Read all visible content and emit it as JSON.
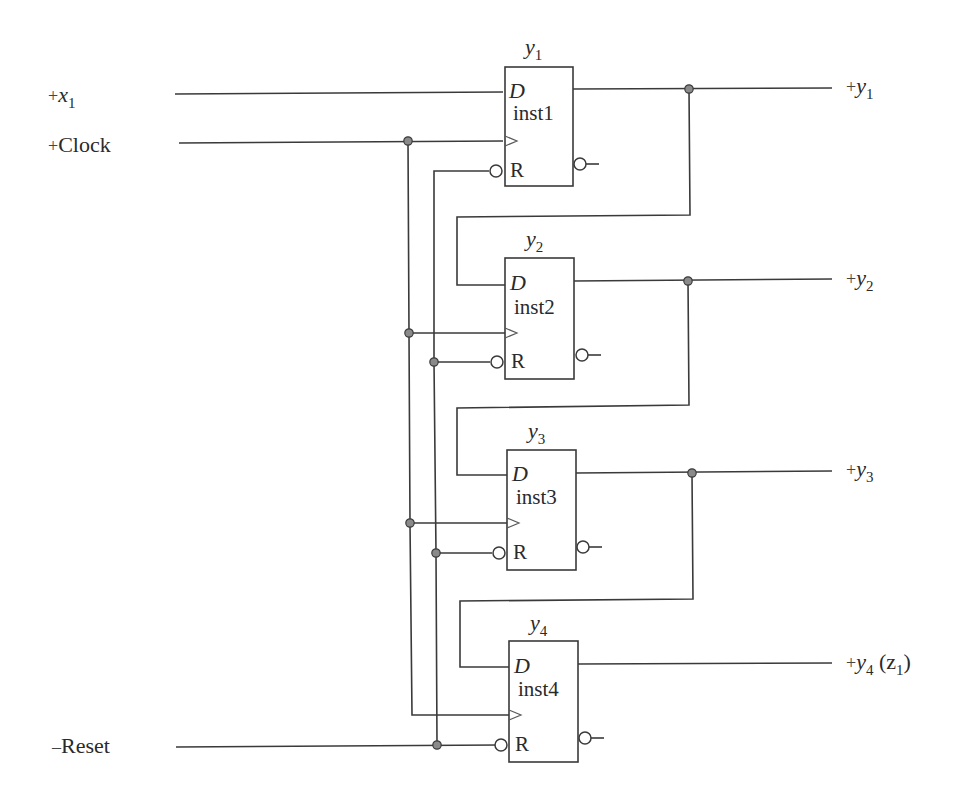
{
  "diagram": {
    "type": "sequential-circuit"
  },
  "inputs": {
    "x1": {
      "sign": "+",
      "name": "x",
      "sub": "1"
    },
    "clock": {
      "sign": "+",
      "name": "Clock"
    },
    "reset": {
      "sign": "–",
      "name": "Reset"
    }
  },
  "flipflops": [
    {
      "title": "y",
      "title_sub": "1",
      "d_pin": "D",
      "instance": "inst1",
      "r_pin": "R"
    },
    {
      "title": "y",
      "title_sub": "2",
      "d_pin": "D",
      "instance": "inst2",
      "r_pin": "R"
    },
    {
      "title": "y",
      "title_sub": "3",
      "d_pin": "D",
      "instance": "inst3",
      "r_pin": "R"
    },
    {
      "title": "y",
      "title_sub": "4",
      "d_pin": "D",
      "instance": "inst4",
      "r_pin": "R"
    }
  ],
  "outputs": [
    {
      "sign": "+",
      "name": "y",
      "sub": "1",
      "extra": ""
    },
    {
      "sign": "+",
      "name": "y",
      "sub": "2",
      "extra": ""
    },
    {
      "sign": "+",
      "name": "y",
      "sub": "3",
      "extra": ""
    },
    {
      "sign": "+",
      "name": "y",
      "sub": "4",
      "extra": "(z",
      "extra_sub": "1",
      "extra_close": ")"
    }
  ],
  "colors": {
    "wire": "#3a3a3a",
    "junction": "#8a8a8a",
    "background": "#ffffff"
  }
}
